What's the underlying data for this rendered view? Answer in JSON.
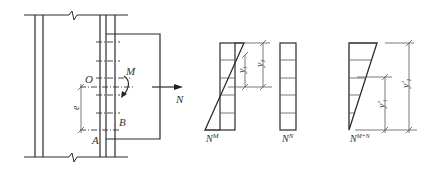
{
  "diagram": {
    "type": "bolted bracket connection under moment and axial force",
    "labels": {
      "moment": "M",
      "axial": "N",
      "center": "O",
      "point_a": "A",
      "point_b": "B",
      "eccentricity": "e",
      "y1": "y",
      "y1_sub": "1",
      "y1_prime": "y'",
      "y1_prime_sub": "1",
      "dist_NM": "N",
      "dist_NM_sup": "M",
      "dist_NN": "N",
      "dist_NN_sup": "N",
      "dist_NMN": "N",
      "dist_NMN_sup": "M+N"
    },
    "panels": [
      "connection-elevation",
      "moment-distribution",
      "axial-distribution",
      "combined-distribution"
    ]
  }
}
